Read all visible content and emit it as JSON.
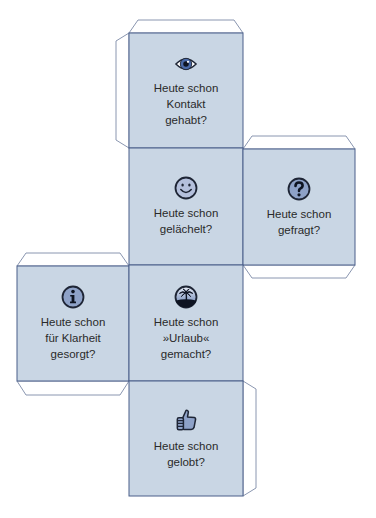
{
  "colors": {
    "face_fill": "#c9d6e4",
    "face_border": "#4a5f8a",
    "tab_border": "#8a96b0",
    "tab_fill": "#ffffff",
    "icon_fill": "#8ea2c8",
    "icon_dark": "#1e2535",
    "text": "#2a2a2a"
  },
  "faces": [
    {
      "id": "top",
      "icon": "eye-icon",
      "lines": [
        "Heute schon",
        "Kontakt",
        "gehabt?"
      ]
    },
    {
      "id": "upper-middle",
      "icon": "smiley-icon",
      "lines": [
        "Heute schon",
        "gelächelt?"
      ]
    },
    {
      "id": "right",
      "icon": "question-mark-icon",
      "lines": [
        "Heute schon",
        "gefragt?"
      ]
    },
    {
      "id": "left",
      "icon": "info-icon",
      "lines": [
        "Heute schon",
        "für Klarheit",
        "gesorgt?"
      ]
    },
    {
      "id": "lower-middle",
      "icon": "palm-island-icon",
      "lines": [
        "Heute schon",
        "»Urlaub«",
        "gemacht?"
      ]
    },
    {
      "id": "bottom",
      "icon": "thumbs-up-icon",
      "lines": [
        "Heute schon",
        "gelobt?"
      ]
    }
  ]
}
